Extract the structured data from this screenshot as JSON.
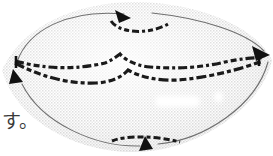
{
  "figure": {
    "title_text": "",
    "caption_fragment": "す。",
    "colors": {
      "background": "#ffffff",
      "fill_stipple": "#d8d8d8",
      "fill_stipple_light": "#ececec",
      "outline_thin": "#6e6e6e",
      "dashed_thick": "#1a1a1a",
      "arrowhead": "#111111",
      "highlight": "#ffffff",
      "text": "#3a3a3a"
    },
    "shape": {
      "type": "lens",
      "description": "eye-shaped closed region formed by two arcs",
      "center_x": 136,
      "center_y": 78,
      "half_width": 136,
      "half_height": 72
    },
    "flow_arrows": [
      {
        "name": "top-arrow",
        "direction": "right",
        "tip_x": 130,
        "tip_y": 17,
        "angle_deg": 35
      },
      {
        "name": "right-arrow",
        "direction": "right",
        "tip_x": 268,
        "tip_y": 54,
        "angle_deg": 20
      },
      {
        "name": "bottom-arrow",
        "direction": "up",
        "tip_x": 146,
        "tip_y": 146,
        "angle_deg": -75
      },
      {
        "name": "left-arrow",
        "direction": "up-left",
        "tip_x": 14,
        "tip_y": 71,
        "angle_deg": -115
      }
    ],
    "dashed_curves": [
      {
        "name": "top-dashed-arc",
        "cap_left": null,
        "cap_right": null
      },
      {
        "name": "middle-dashed-upper",
        "cap_left": "tick",
        "cap_right": "tick"
      },
      {
        "name": "middle-dashed-lower",
        "cap_left": "tick",
        "cap_right": "tick"
      },
      {
        "name": "bottom-dashed-arc",
        "cap_left": null,
        "cap_right": null
      }
    ],
    "highlights": [
      {
        "name": "highlight-bar",
        "x": 155,
        "y": 96,
        "w": 45,
        "h": 11
      },
      {
        "name": "highlight-dot",
        "x": 214,
        "y": 92,
        "w": 9,
        "h": 11
      }
    ]
  }
}
